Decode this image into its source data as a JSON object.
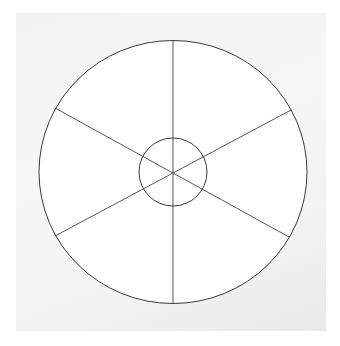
{
  "image": {
    "description": "Hand-drawn wheel diagram on white paper: large outer circle divided into six segments by three lines through the center, with a small inner circle at the hub",
    "background_color": "#f3f3f3",
    "paper_color": "#ffffff",
    "stroke_color": "#3a3a3a"
  },
  "drawing": {
    "outer_circle": {
      "cx": 173,
      "cy": 172,
      "rx": 134,
      "ry": 132
    },
    "inner_circle": {
      "cx": 173,
      "cy": 172,
      "r": 34
    },
    "segments": 6
  }
}
